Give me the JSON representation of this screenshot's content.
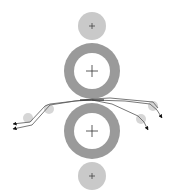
{
  "diagram": {
    "type": "roller-nip-web-path",
    "colors": {
      "background": "#ffffff",
      "small_roller": "#c9c9c9",
      "big_roller_ring": "#9a9a9a",
      "big_roller_core": "#ffffff",
      "guide_roller": "#d6d6d6",
      "web_line": "#555555",
      "crosshair": "#333333",
      "arrow": "#111111"
    },
    "rollers": [
      {
        "id": "top-small-roller",
        "cx": 92,
        "cy": 26,
        "r": 14,
        "kind": "small"
      },
      {
        "id": "upper-big-roller",
        "cx": 92,
        "cy": 71,
        "r": 28,
        "inner_r": 18,
        "kind": "big"
      },
      {
        "id": "lower-big-roller",
        "cx": 92,
        "cy": 131,
        "r": 28,
        "inner_r": 18,
        "kind": "big"
      },
      {
        "id": "bottom-small-roller",
        "cx": 92,
        "cy": 176,
        "r": 14,
        "kind": "small"
      }
    ],
    "guide_rollers": [
      {
        "id": "left-guide-1",
        "cx": 49,
        "cy": 109,
        "r": 5
      },
      {
        "id": "left-guide-2",
        "cx": 28,
        "cy": 118,
        "r": 5
      },
      {
        "id": "right-guide-1",
        "cx": 153,
        "cy": 106,
        "r": 5
      },
      {
        "id": "right-guide-2",
        "cx": 141,
        "cy": 119,
        "r": 5
      }
    ],
    "nip": {
      "x": 92,
      "y": 100
    }
  }
}
